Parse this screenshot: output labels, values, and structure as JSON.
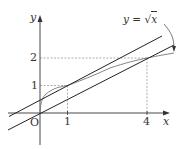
{
  "diagram": {
    "curve_label": {
      "lhs": "y",
      "eq": " = ",
      "radical": "√",
      "arg": "x"
    },
    "axes": {
      "x_label": "x",
      "y_label": "y",
      "origin_label": "O"
    },
    "ticks": {
      "x": [
        {
          "value": 1,
          "label": "1"
        },
        {
          "value": 4,
          "label": "4"
        }
      ],
      "y": [
        {
          "value": 1,
          "label": "1"
        },
        {
          "value": 2,
          "label": "2"
        }
      ]
    },
    "elements": [
      {
        "type": "curve",
        "function": "y = sqrt(x)",
        "domain": [
          0,
          5.0
        ]
      },
      {
        "type": "line",
        "equation": "y = x/2 + 1/2",
        "note": "tangent to curve at (1,1)"
      },
      {
        "type": "line",
        "equation": "y = x/2",
        "note": "passes through O and (4,2)"
      },
      {
        "type": "dashed-guides",
        "points": [
          [
            1,
            1
          ],
          [
            4,
            2
          ]
        ]
      }
    ],
    "colors": {
      "axis": "#333333",
      "line": "#222222",
      "curve": "#777777",
      "guide": "#999999"
    }
  }
}
